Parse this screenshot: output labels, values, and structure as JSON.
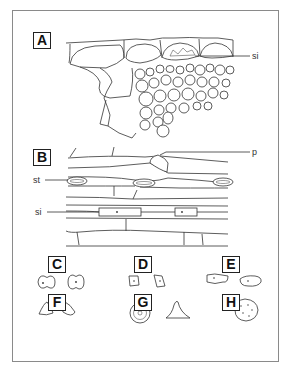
{
  "figure": {
    "panels": [
      {
        "id": "A",
        "label": "A",
        "description": "transverse section of epidermis and underlying tissue"
      },
      {
        "id": "B",
        "label": "B",
        "description": "surface view of epidermis"
      },
      {
        "id": "C",
        "label": "C",
        "description": "short cells, saddle/dumbbell shaped"
      },
      {
        "id": "D",
        "label": "D",
        "description": "short cells, rectangular"
      },
      {
        "id": "E",
        "label": "E",
        "description": "short cells, elongated"
      },
      {
        "id": "F",
        "label": "F",
        "description": "short cells, triangular"
      },
      {
        "id": "G",
        "label": "G",
        "description": "papilla and prickle"
      },
      {
        "id": "H",
        "label": "H",
        "description": "rounded cell with granules"
      }
    ],
    "callouts": {
      "si_A": "si",
      "p": "p",
      "st": "st",
      "si_B": "si"
    }
  }
}
